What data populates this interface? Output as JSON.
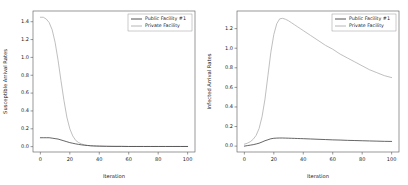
{
  "figure": {
    "background": "#ffffff",
    "axis_color": "#555555",
    "text_color": "#222222",
    "legend_border_color": "#999999"
  },
  "chart_data": [
    {
      "type": "line",
      "title": "",
      "xlabel": "Iteration",
      "ylabel": "Susceptible Arrival Rates",
      "xlim": [
        -5,
        105
      ],
      "ylim": [
        -0.06,
        1.52
      ],
      "xticks": [
        0,
        20,
        40,
        60,
        80,
        100
      ],
      "yticks": [
        0.0,
        0.2,
        0.4,
        0.6,
        0.8,
        1.0,
        1.2,
        1.4
      ],
      "grid": false,
      "legend_position": "upper-right",
      "x": [
        0,
        2,
        4,
        6,
        8,
        10,
        12,
        14,
        16,
        18,
        20,
        22,
        24,
        26,
        28,
        30,
        32,
        34,
        36,
        38,
        40,
        45,
        50,
        55,
        60,
        65,
        70,
        75,
        80,
        85,
        90,
        95,
        100
      ],
      "series": [
        {
          "name": "Public Facility #1",
          "color": "#3f3f3f",
          "values": [
            0.1,
            0.1,
            0.1,
            0.1,
            0.095,
            0.09,
            0.085,
            0.075,
            0.065,
            0.055,
            0.045,
            0.038,
            0.031,
            0.025,
            0.02,
            0.016,
            0.013,
            0.01,
            0.008,
            0.007,
            0.006,
            0.004,
            0.003,
            0.003,
            0.002,
            0.002,
            0.002,
            0.002,
            0.002,
            0.002,
            0.002,
            0.002,
            0.002
          ]
        },
        {
          "name": "Private Facility",
          "color": "#aeaeae",
          "values": [
            1.45,
            1.45,
            1.43,
            1.39,
            1.31,
            1.17,
            0.97,
            0.74,
            0.52,
            0.33,
            0.2,
            0.12,
            0.07,
            0.045,
            0.03,
            0.02,
            0.014,
            0.01,
            0.008,
            0.006,
            0.005,
            0.004,
            0.003,
            0.003,
            0.002,
            0.002,
            0.002,
            0.002,
            0.002,
            0.002,
            0.002,
            0.002,
            0.002
          ]
        }
      ]
    },
    {
      "type": "line",
      "title": "",
      "xlabel": "Iteration",
      "ylabel": "Infected Arrival Rates",
      "xlim": [
        -5,
        105
      ],
      "ylim": [
        -0.06,
        1.38
      ],
      "xticks": [
        0,
        20,
        40,
        60,
        80,
        100
      ],
      "yticks": [
        0.0,
        0.2,
        0.4,
        0.6,
        0.8,
        1.0,
        1.2
      ],
      "grid": false,
      "legend_position": "upper-right",
      "x": [
        0,
        2,
        4,
        6,
        8,
        10,
        12,
        14,
        16,
        18,
        20,
        22,
        24,
        26,
        28,
        30,
        32,
        34,
        36,
        38,
        40,
        45,
        50,
        55,
        60,
        65,
        70,
        75,
        80,
        85,
        90,
        95,
        100
      ],
      "series": [
        {
          "name": "Public Facility #1",
          "color": "#3f3f3f",
          "values": [
            0.0,
            0.005,
            0.01,
            0.015,
            0.022,
            0.03,
            0.042,
            0.055,
            0.065,
            0.075,
            0.08,
            0.082,
            0.083,
            0.083,
            0.082,
            0.081,
            0.08,
            0.079,
            0.078,
            0.077,
            0.076,
            0.073,
            0.07,
            0.067,
            0.064,
            0.062,
            0.059,
            0.057,
            0.055,
            0.053,
            0.051,
            0.049,
            0.048
          ]
        },
        {
          "name": "Private Facility",
          "color": "#aeaeae",
          "values": [
            0.02,
            0.03,
            0.045,
            0.07,
            0.11,
            0.18,
            0.3,
            0.48,
            0.72,
            0.96,
            1.14,
            1.25,
            1.3,
            1.305,
            1.295,
            1.28,
            1.26,
            1.24,
            1.22,
            1.2,
            1.18,
            1.13,
            1.08,
            1.03,
            0.99,
            0.94,
            0.9,
            0.86,
            0.82,
            0.78,
            0.75,
            0.72,
            0.7
          ]
        }
      ]
    }
  ]
}
